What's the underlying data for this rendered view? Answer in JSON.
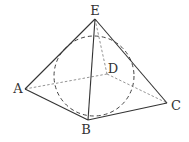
{
  "diagram": {
    "type": "geometry",
    "vertices": {
      "A": {
        "label": "A",
        "x": 25,
        "y": 89,
        "lx": 18,
        "ly": 93
      },
      "B": {
        "label": "B",
        "x": 88,
        "y": 120,
        "lx": 86,
        "ly": 134
      },
      "C": {
        "label": "C",
        "x": 167,
        "y": 103,
        "lx": 176,
        "ly": 110
      },
      "D": {
        "label": "D",
        "x": 107,
        "y": 74,
        "lx": 113,
        "ly": 73
      },
      "E": {
        "label": "E",
        "x": 95,
        "y": 19,
        "lx": 95,
        "ly": 15
      }
    },
    "visible_edges": [
      [
        "E",
        "A"
      ],
      [
        "E",
        "B"
      ],
      [
        "E",
        "C"
      ],
      [
        "A",
        "B"
      ],
      [
        "B",
        "C"
      ]
    ],
    "hidden_edges": [
      [
        "E",
        "D"
      ],
      [
        "A",
        "D"
      ],
      [
        "D",
        "C"
      ]
    ],
    "sphere": {
      "cx": 94,
      "cy": 76,
      "r": 40,
      "style": "dashed"
    }
  }
}
